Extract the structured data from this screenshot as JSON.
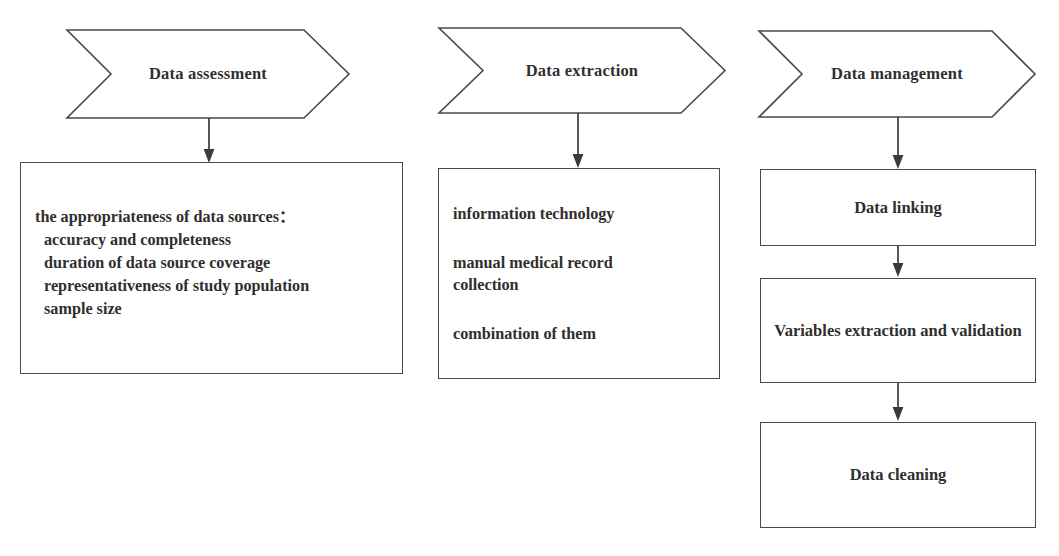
{
  "diagram": {
    "stroke_color": "#4a4a4a",
    "text_color": "#2f2f2f",
    "background": "#ffffff",
    "columns": [
      {
        "id": "data-assessment",
        "banner": "Data assessment",
        "box": {
          "id": "assessment-criteria",
          "lines": [
            "the appropriateness of data sources：",
            "accuracy and completeness",
            "duration of data source coverage",
            "representativeness of study population",
            "sample size"
          ]
        }
      },
      {
        "id": "data-extraction",
        "banner": "Data extraction",
        "box": {
          "id": "extraction-methods",
          "paragraphs": [
            {
              "line1": "information technology",
              "line2": ""
            },
            {
              "line1": "manual medical record",
              "line2": "collection"
            },
            {
              "line1": "combination of them",
              "line2": ""
            }
          ]
        }
      },
      {
        "id": "data-management",
        "banner": "Data management",
        "steps": [
          {
            "id": "data-linking",
            "label": "Data linking"
          },
          {
            "id": "variables-extraction-and-validation",
            "label": "Variables extraction and validation"
          },
          {
            "id": "data-cleaning",
            "label": "Data cleaning"
          }
        ]
      }
    ]
  }
}
